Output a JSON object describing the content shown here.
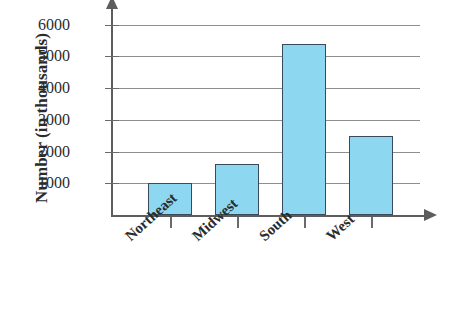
{
  "chart_data": {
    "type": "bar",
    "title": "",
    "xlabel": "",
    "ylabel": "Number (in thousands)",
    "categories": [
      "Northeast",
      "Midwest",
      "South",
      "West"
    ],
    "values": [
      1000,
      1600,
      5400,
      2500
    ],
    "yticks": [
      1000,
      2000,
      3000,
      4000,
      5000,
      6000
    ],
    "ytick_labels": [
      "1000",
      "2000",
      "3000",
      "4000",
      "5000",
      "6000"
    ],
    "ylim": [
      0,
      6400
    ],
    "grid": true,
    "legend": false,
    "legend_position": "none",
    "series": [
      {
        "name": "Number (in thousands)",
        "values": [
          1000,
          1600,
          5400,
          2500
        ]
      }
    ],
    "colors": {
      "bar_fill": "#8dd8f0",
      "bar_border": "#3a4a5c",
      "gridline": "#8e8e8e",
      "axis": "#5d5d5d",
      "text": "#2b2b2b",
      "background": "#ffffff"
    },
    "axis_arrows": {
      "y": "up-arrow-icon",
      "x": "right-arrow-icon"
    }
  }
}
